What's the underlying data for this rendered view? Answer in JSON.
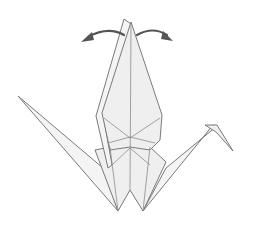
{
  "diagram": {
    "step_description": "Pull the wings apart / spread wings outward",
    "colors": {
      "paper_fill": "#efefef",
      "paper_edge": "#7a7a7a",
      "crease": "#8c8c8c",
      "arrow": "#555555",
      "background": "#ffffff"
    },
    "annotations": [
      {
        "type": "curved-arrow",
        "direction": "left",
        "meaning": "pull left wing outward"
      },
      {
        "type": "curved-arrow",
        "direction": "right",
        "meaning": "pull right wing outward"
      }
    ],
    "parts": [
      "left-wing-flap",
      "right-wing-flap",
      "body",
      "tail",
      "neck",
      "head"
    ]
  }
}
